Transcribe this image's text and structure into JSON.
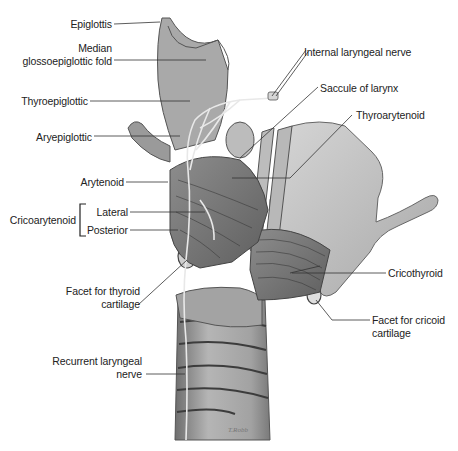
{
  "figure": {
    "colors": {
      "background": "#ffffff",
      "tissue_light": "#c9c9c9",
      "tissue_mid": "#9a9a9a",
      "tissue_dark": "#5e5e5e",
      "leader_line": "#333333",
      "label_text": "#222222"
    },
    "signature": "T.Robb"
  },
  "labels": {
    "epiglottis": "Epiglottis",
    "median_fold_line1": "Median",
    "median_fold_line2": "glossoepiglottic fold",
    "thyroepiglottic": "Thyroepiglottic",
    "aryepiglottic": "Aryepiglottic",
    "arytenoid": "Arytenoid",
    "cricoarytenoid": "Cricoarytenoid",
    "lateral": "Lateral",
    "posterior": "Posterior",
    "facet_thyroid_line1": "Facet for thyroid",
    "facet_thyroid_line2": "cartilage",
    "recurrent_line1": "Recurrent laryngeal",
    "recurrent_line2": "nerve",
    "internal_laryngeal": "Internal laryngeal nerve",
    "saccule": "Saccule of larynx",
    "thyroarytenoid": "Thyroarytenoid",
    "cricothyroid": "Cricothyroid",
    "facet_cricoid_line1": "Facet for cricoid",
    "facet_cricoid_line2": "cartilage"
  }
}
